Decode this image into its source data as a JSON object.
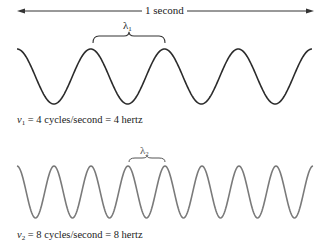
{
  "diagram": {
    "time_span": {
      "label": "1 second",
      "x_start": 17,
      "x_end": 314,
      "y": 11
    },
    "waves": [
      {
        "id": "wave-1",
        "symbol": "ν",
        "subscript": "1",
        "cycles": 4,
        "caption_rest": " = 4 cycles/second = 4 hertz",
        "wavelength_symbol": "λ",
        "wavelength_subscript": "1",
        "color": "#2b2b2b",
        "x_start": 17,
        "x_end": 312,
        "y_peak": 49,
        "y_trough": 104,
        "brace": {
          "x1": 93,
          "x2": 165,
          "y": 43
        }
      },
      {
        "id": "wave-2",
        "symbol": "ν",
        "subscript": "2",
        "cycles": 8,
        "caption_rest": " = 8 cycles/second = 8 hertz",
        "wavelength_symbol": "λ",
        "wavelength_subscript": "2",
        "color": "#7a7a7a",
        "x_start": 17,
        "x_end": 313,
        "y_peak": 166,
        "y_trough": 218,
        "brace": {
          "x1": 129,
          "x2": 165,
          "y": 162
        }
      }
    ]
  }
}
